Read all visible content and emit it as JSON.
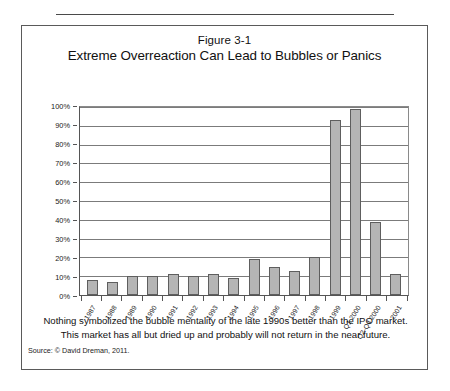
{
  "figure": {
    "number": "Figure 3-1",
    "title": "Extreme Overreaction Can Lead to Bubbles or Panics",
    "caption_line1": "Nothing symbolized the bubble mentality of the late 1990s better than the IPO market.",
    "caption_line2": "This market has all but dried up and probably will not return in the near future.",
    "source": "Source: © David Dreman, 2011."
  },
  "chart_data": {
    "type": "bar",
    "title": "Extreme Overreaction Can Lead to Bubbles or Panics",
    "xlabel": "",
    "ylabel": "",
    "ylim": [
      0,
      100
    ],
    "yticks": [
      "0%",
      "10%",
      "20%",
      "30%",
      "40%",
      "50%",
      "60%",
      "70%",
      "80%",
      "90%",
      "100%"
    ],
    "ytick_values": [
      0,
      10,
      20,
      30,
      40,
      50,
      60,
      70,
      80,
      90,
      100
    ],
    "grid": true,
    "legend": "none",
    "categories": [
      "1987",
      "1988",
      "1989",
      "1990",
      "1991",
      "1992",
      "1993",
      "1994",
      "1995",
      "1996",
      "1997",
      "1998",
      "1999",
      "Q1 2000",
      "Q2-Q4 2000",
      "2001"
    ],
    "values": [
      8,
      7,
      10,
      10,
      11,
      10,
      11,
      9,
      19,
      15,
      13,
      20,
      93,
      99,
      39,
      11
    ],
    "bar_color": "#b5b5b5",
    "bar_border_color": "#5e5e5e",
    "axis_color": "#555555",
    "grid_color": "#7b7b7b"
  }
}
